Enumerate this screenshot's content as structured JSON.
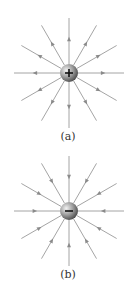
{
  "colors": {
    "line": "#9a9a9a",
    "arrow": "#8a8a8a",
    "charge_light": "#e0e0e0",
    "charge_dark": "#555555",
    "sign": "#111111"
  },
  "panels": [
    {
      "id": "a",
      "label": "(a)",
      "charge": "+",
      "direction": "outward",
      "cx": 69,
      "cy": 73,
      "label_y": 130
    },
    {
      "id": "b",
      "label": "(b)",
      "charge": "−",
      "direction": "inward",
      "cx": 69,
      "cy": 211,
      "label_y": 268
    }
  ],
  "field": {
    "line_count": 12,
    "line_length": 55,
    "charge_radius": 9
  }
}
